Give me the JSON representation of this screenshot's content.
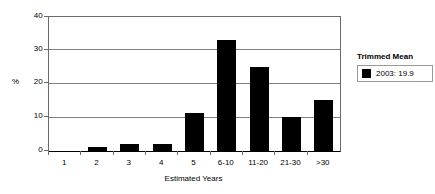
{
  "chart_data": {
    "type": "bar",
    "title": "",
    "subtitle": "",
    "xlabel": "Estimated Years",
    "ylabel": "%",
    "categories": [
      "1",
      "2",
      "3",
      "4",
      "5",
      "6-10",
      "11-20",
      "21-30",
      ">30"
    ],
    "values": [
      0,
      1.2,
      2.2,
      2.2,
      11.2,
      33.2,
      25.2,
      10.1,
      15.2
    ],
    "series": [
      {
        "name": "2003: 19.9",
        "values": [
          0,
          1.2,
          2.2,
          2.2,
          11.2,
          33.2,
          25.2,
          10.1,
          15.2
        ],
        "color": "#000000"
      }
    ],
    "ylim": [
      0,
      40
    ],
    "yticks": [
      0,
      10,
      20,
      30,
      40
    ],
    "ytick_labels": [
      "0",
      "10",
      "20",
      "30",
      "40"
    ],
    "grid": "horizontal",
    "legend_position": "right",
    "bar_color": "#000000"
  },
  "legend": {
    "title": "Trimmed Mean",
    "entries": [
      {
        "label": "2003: 19.9",
        "color": "#000000"
      }
    ]
  },
  "axes": {
    "y_title": "%",
    "x_title": "Estimated Years"
  }
}
